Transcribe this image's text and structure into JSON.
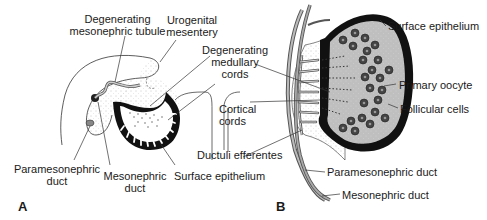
{
  "panels": {
    "A": {
      "letter": "A",
      "labels": {
        "degenerating_mesonephric_tubule_1": "Degenerating",
        "degenerating_mesonephric_tubule_2": "mesonephric tubule",
        "urogenital_mesentery_1": "Urogenital",
        "urogenital_mesentery_2": "mesentery",
        "degenerating_medullary_cords_1": "Degenerating",
        "degenerating_medullary_cords_2": "medullary",
        "degenerating_medullary_cords_3": "cords",
        "cortical_cords_1": "Cortical",
        "cortical_cords_2": "cords",
        "ductuli_efferentes": "Ductuli efferentes",
        "paramesonephric_duct_1": "Paramesonephric",
        "paramesonephric_duct_2": "duct",
        "mesonephric_duct_1": "Mesonephric",
        "mesonephric_duct_2": "duct",
        "surface_epithelium": "Surface epithelium"
      }
    },
    "B": {
      "letter": "B",
      "labels": {
        "surface_epithelium": "Surface epithelium",
        "primary_oocyte": "Primary oocyte",
        "follicular_cells": "Follicular cells",
        "paramesonephric_duct": "Paramesonephric duct",
        "mesonephric_duct": "Mesonephric duct"
      }
    }
  }
}
